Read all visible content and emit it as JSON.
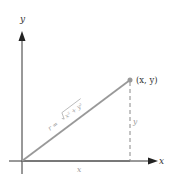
{
  "diagram": {
    "axes": {
      "x_label": "x",
      "y_label": "y",
      "color": "#222222"
    },
    "point": {
      "label": "(x, y)",
      "color": "#999999"
    },
    "radius_line": {
      "label_prefix": "r = ",
      "label_sqrt": "x² + y²",
      "color": "#999999"
    },
    "legs": {
      "horizontal_label": "x",
      "vertical_label": "y",
      "label_color": "#999999"
    }
  }
}
